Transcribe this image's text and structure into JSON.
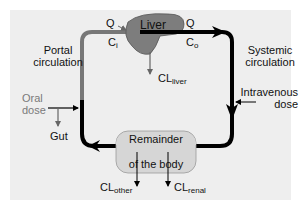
{
  "diagram": {
    "nodes": {
      "liver": "Liver",
      "remainder_line1": "Remainder",
      "remainder_line2": "of the body"
    },
    "labels": {
      "portal_line1": "Portal",
      "portal_line2": "circulation",
      "systemic_line1": "Systemic",
      "systemic_line2": "circulation",
      "oral_line1": "Oral",
      "oral_line2": "dose",
      "gut": "Gut",
      "iv_line1": "Intravenous",
      "iv_line2": "dose",
      "q_in": "Q",
      "c_in": "C",
      "c_in_sub": "i",
      "q_out": "Q",
      "c_out": "C",
      "c_out_sub": "o",
      "cl_liver": "CL",
      "cl_liver_sub": "liver",
      "cl_other": "CL",
      "cl_other_sub": "other",
      "cl_renal": "CL",
      "cl_renal_sub": "renal"
    },
    "colors": {
      "panel": "#eeeeee",
      "liver_fill": "#7d7d7d",
      "remainder_fill": "#d6d6d6",
      "portal_path": "#777777",
      "systemic_path": "#000000",
      "muted_text": "#7a7a7a"
    }
  }
}
